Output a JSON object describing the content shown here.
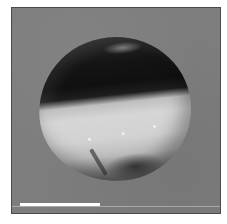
{
  "image": {
    "subject": "spherical egg / oocyte micrograph",
    "background_color": "#7d7d7d",
    "frame_border_color": "#4a4a4a",
    "hemispheres": {
      "top": {
        "description": "dark pigmented animal hemisphere",
        "color": "#141414"
      },
      "bottom": {
        "description": "light vegetal hemisphere",
        "color": "#d4d4d4"
      }
    }
  },
  "scale_bar": {
    "color": "#ffffff",
    "length_px": 80
  }
}
